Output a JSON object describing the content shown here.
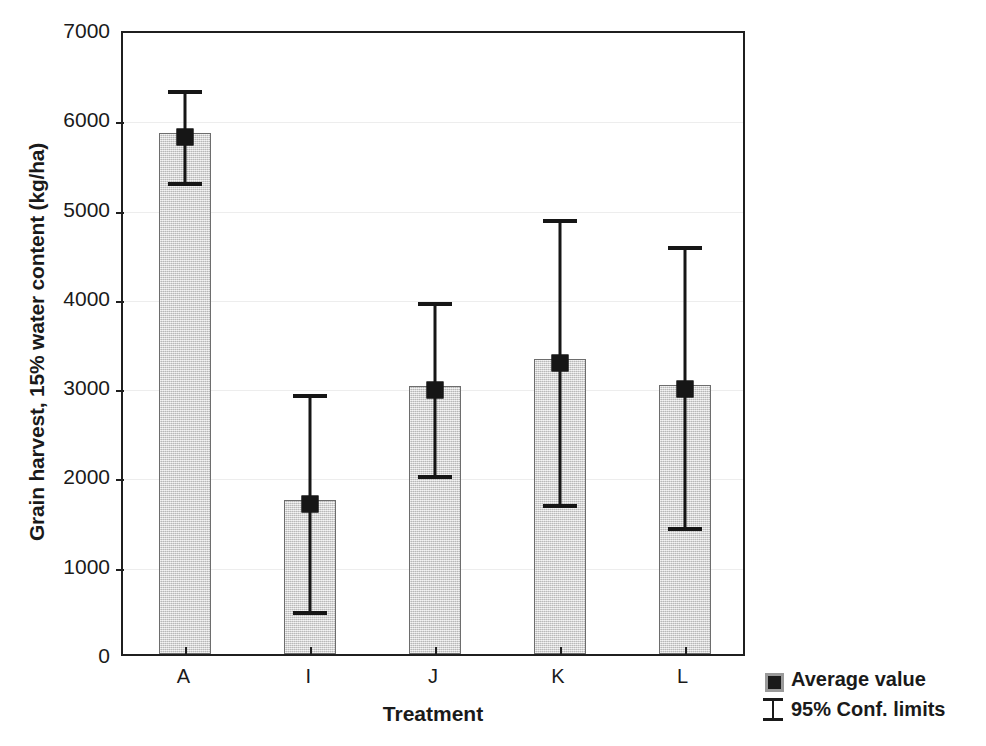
{
  "chart_data": {
    "type": "bar",
    "title": "",
    "xlabel": "Treatment",
    "ylabel": "Grain harvest, 15% water content (kg/ha)",
    "categories": [
      "A",
      "I",
      "J",
      "K",
      "L"
    ],
    "values": [
      5830,
      1730,
      3000,
      3300,
      3010
    ],
    "error_upper": [
      6340,
      2930,
      3970,
      4900,
      4590
    ],
    "error_lower": [
      5310,
      500,
      2030,
      1700,
      1440
    ],
    "error_type": "95% confidence limits",
    "ylim": [
      0,
      7000
    ],
    "ytick_values": [
      0,
      1000,
      2000,
      3000,
      4000,
      5000,
      6000,
      7000
    ],
    "ytick_labels": [
      "0",
      "1000",
      "2000",
      "3000",
      "4000",
      "5000",
      "6000",
      "7000"
    ],
    "grid": true,
    "legend_position": "bottom-right",
    "legend": [
      {
        "label": "Average value",
        "symbol": "filled-square-marker"
      },
      {
        "label": "95% Conf. limits",
        "symbol": "i-beam-errorbar"
      }
    ],
    "colors": {
      "bar_fill": "#d4d4d4",
      "bar_border": "#6d6d6d",
      "marker": "#161616",
      "axis": "#1f1f1f",
      "gridline": "#ededed"
    }
  }
}
